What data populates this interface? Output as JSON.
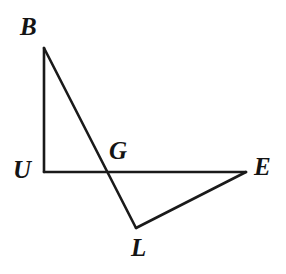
{
  "figure": {
    "background_color": "#ffffff",
    "stroke_color": "#1a1a1a",
    "label_color": "#141414",
    "stroke_width": 2.6,
    "canvas": {
      "width": 286,
      "height": 274
    },
    "points": {
      "B": {
        "label": "B",
        "x": 44,
        "y": 48,
        "label_x": 20,
        "label_y": 14
      },
      "U": {
        "label": "U",
        "x": 44,
        "y": 172,
        "label_x": 13,
        "label_y": 157
      },
      "G": {
        "label": "G",
        "x": 105,
        "y": 172,
        "label_x": 109,
        "label_y": 138
      },
      "E": {
        "label": "E",
        "x": 246,
        "y": 172,
        "label_x": 254,
        "label_y": 154
      },
      "L": {
        "label": "L",
        "x": 136,
        "y": 228,
        "label_x": 131,
        "label_y": 235
      }
    },
    "segments": [
      {
        "name": "segment-UB",
        "from": "U",
        "to": "B",
        "d": "M 44 172 L 44 48"
      },
      {
        "name": "segment-BL",
        "from": "B",
        "to": "L",
        "d": "M 44 48 L 136 228"
      },
      {
        "name": "segment-UE",
        "from": "U",
        "to": "E",
        "d": "M 44 172 L 246 172"
      },
      {
        "name": "segment-LE",
        "from": "L",
        "to": "E",
        "d": "M 136 228 L 246 172"
      }
    ],
    "labels_order": [
      "B",
      "U",
      "G",
      "E",
      "L"
    ]
  }
}
